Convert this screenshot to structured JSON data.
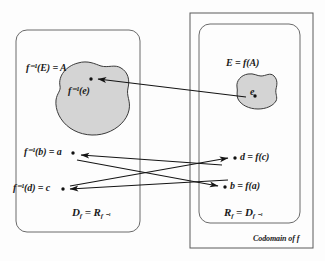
{
  "figure": {
    "type": "set-mapping-diagram",
    "colors": {
      "blob_fill": "#d4d4d4",
      "blob_stroke": "#3a3a3a",
      "box_stroke": "#555555",
      "arrow": "#1a1a1a",
      "text": "#1a1a1a",
      "background": "#fdfdfd"
    }
  },
  "left_region": {
    "name": "domain-box",
    "blob_label": "f⁻¹(E) = A",
    "blob_inner_label": "f⁻¹(e)",
    "point_labels": [
      {
        "id": "a",
        "text": "f⁻¹(b) = a"
      },
      {
        "id": "c",
        "text": "f⁻¹(d) = c"
      }
    ],
    "footer": {
      "main": "D",
      "sub1": "f",
      "eq": "=",
      "main2": "R",
      "sub2": "f ⁻¹"
    },
    "footer_text": "D f = R f ⁻¹"
  },
  "right_region": {
    "name": "codomain-box",
    "blob_label": "E = f(A)",
    "blob_inner_label": "e",
    "point_labels": [
      {
        "id": "d",
        "text": "d = f(c)"
      },
      {
        "id": "b",
        "text": "b = f(a)"
      }
    ],
    "footer": {
      "main": "R",
      "sub1": "f",
      "eq": "=",
      "main2": "D",
      "sub2": "f ⁻¹"
    },
    "footer_text": "R f = D f ⁻¹",
    "outer_caption": "Codomain of f"
  },
  "arrows": [
    {
      "name": "arrow-e-to-finv-e",
      "from": "e",
      "to": "f⁻¹(e)",
      "direction": "right-to-left"
    },
    {
      "name": "arrow-d-to-c",
      "from": "d",
      "to": "c",
      "direction": "right-to-left"
    },
    {
      "name": "arrow-a-to-b",
      "from": "a",
      "to": "b",
      "direction": "left-to-right"
    }
  ]
}
